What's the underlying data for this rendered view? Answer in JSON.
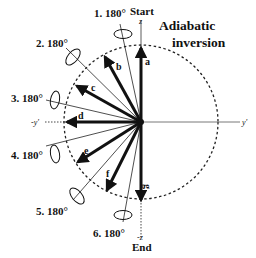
{
  "title": {
    "line1": "Adiabatic",
    "line2": "inversion"
  },
  "axes": {
    "z_top": "z",
    "z_bottom": "-z",
    "y_right": "y'",
    "y_left": "-y'",
    "start_label": "Start",
    "end_label": "End"
  },
  "pulses": [
    {
      "label": "1. 180°"
    },
    {
      "label": "2. 180°"
    },
    {
      "label": "3. 180°"
    },
    {
      "label": "4. 180°"
    },
    {
      "label": "5. 180°"
    },
    {
      "label": "6. 180°"
    }
  ],
  "vectors": [
    {
      "label": "a"
    },
    {
      "label": "b"
    },
    {
      "label": "c"
    },
    {
      "label": "d"
    },
    {
      "label": "e"
    },
    {
      "label": "f"
    },
    {
      "label": "g"
    }
  ],
  "colors": {
    "ink": "#111111",
    "background": "#ffffff"
  }
}
